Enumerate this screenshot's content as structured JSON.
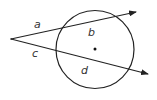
{
  "diagram": {
    "type": "circle-two-secants",
    "colors": {
      "stroke": "#222222",
      "label": "#333333",
      "background": "#ffffff"
    },
    "external_point": {
      "x": 11,
      "y": 39
    },
    "circle": {
      "cx": 95,
      "cy": 49.5,
      "r": 39,
      "center_dot": true
    },
    "secants": [
      {
        "name": "upper",
        "from": [
          11,
          39
        ],
        "to": [
          136,
          12
        ]
      },
      {
        "name": "lower",
        "from": [
          11,
          39
        ],
        "to": [
          148,
          74
        ]
      }
    ],
    "labels": {
      "a": "a",
      "b": "b",
      "c": "c",
      "d": "d"
    }
  }
}
